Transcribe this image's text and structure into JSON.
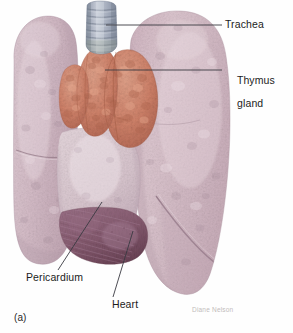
{
  "figure": {
    "panel_letter": "(a)",
    "credit": "Diane Nelson"
  },
  "labels": {
    "trachea": "Trachea",
    "thymus_line1": "Thymus",
    "thymus_line2": "gland",
    "pericardium": "Pericardium",
    "heart": "Heart"
  },
  "structures": [
    {
      "name": "trachea",
      "label": "Trachea",
      "color": "#9aa3b4"
    },
    {
      "name": "thymus-gland",
      "label": "Thymus gland",
      "color": "#cf8169"
    },
    {
      "name": "left-lung",
      "label": "Left lung",
      "color": "#d8c2cb"
    },
    {
      "name": "right-lung",
      "label": "Right lung",
      "color": "#d5bcc6"
    },
    {
      "name": "heart",
      "label": "Heart",
      "color": "#8e6478"
    },
    {
      "name": "pericardium",
      "label": "Pericardium",
      "color": "#d9c8d0"
    }
  ],
  "colors": {
    "background": "#fefefe",
    "lung": "#d8c2cb",
    "lung_shadow": "#bda3b0",
    "lung_light": "#e6d6dc",
    "thymus": "#cf8169",
    "thymus_dark": "#b36a53",
    "thymus_light": "#dd9c84",
    "trachea": "#9aa3b4",
    "trachea_light": "#c3c8d3",
    "heart": "#8e6478",
    "heart_dark": "#71495c",
    "pericardium": "#d9c8d0",
    "leader_line": "#3a3a42",
    "label_text": "#1c1c1c",
    "credit_text": "#c2bcbc"
  }
}
